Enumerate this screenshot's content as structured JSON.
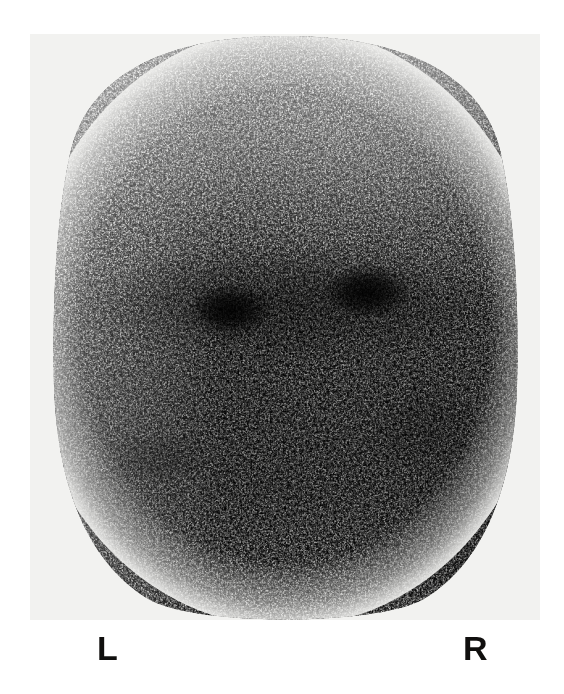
{
  "figure": {
    "kind": "nuclear-medicine-scintigram",
    "modality_text": "",
    "markers": {
      "left_label": "L",
      "right_label": "R"
    },
    "colors": {
      "page_background": "#ffffff",
      "film_background": "#f2f2f0",
      "speckle_dark": "#121110",
      "speckle_light": "#f0efed",
      "marker_text": "#100f0e"
    },
    "field": {
      "x": 30,
      "y": 34,
      "width": 510,
      "height": 586
    },
    "foci": [
      {
        "name": "left-focus",
        "cx": 0.39,
        "cy": 0.47,
        "rx": 0.085,
        "ry": 0.048
      },
      {
        "name": "right-focus",
        "cx": 0.66,
        "cy": 0.44,
        "rx": 0.09,
        "ry": 0.05
      }
    ],
    "regions": [
      {
        "name": "superior-band",
        "relative_intensity": "light"
      },
      {
        "name": "mid-band",
        "relative_intensity": "dark"
      },
      {
        "name": "inferior-band",
        "relative_intensity": "dark"
      },
      {
        "name": "left-lateral-margin",
        "relative_intensity": "light"
      },
      {
        "name": "right-lateral-margin",
        "relative_intensity": "dark"
      }
    ]
  }
}
